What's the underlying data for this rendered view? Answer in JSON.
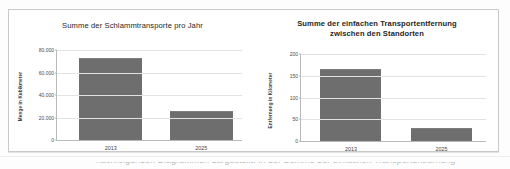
{
  "document": {
    "cutoff_text": "nachfolgenden Diagrammen dargestellt. In der Summe der einfachen Transportentfernung"
  },
  "charts": [
    {
      "id": "schlammtransporte",
      "title_lines": [
        "Summe der Schlammtransporte pro Jahr"
      ],
      "chart_data": {
        "type": "bar",
        "title": "Summe der Schlammtransporte pro Jahr",
        "xlabel": "",
        "ylabel": "Menge in Kubikmeter",
        "categories": [
          "2013",
          "2025"
        ],
        "values": [
          73000,
          26000
        ],
        "ylim": [
          0,
          80000
        ],
        "yticks": [
          "0",
          "20.000",
          "40.000",
          "60.000",
          "80.000"
        ],
        "ytick_values": [
          0,
          20000,
          40000,
          60000,
          80000
        ],
        "grid": true,
        "legend": "none",
        "series_color": "#6e6e6e"
      }
    },
    {
      "id": "transportentfernung",
      "title_lines": [
        "Summe der einfachen Transportentfernung",
        "zwischen den Standorten"
      ],
      "chart_data": {
        "type": "bar",
        "title": "Summe der einfachen Transportentfernung zwischen den Standorten",
        "xlabel": "",
        "ylabel": "Entfernung in Kilometer",
        "categories": [
          "2013",
          "2025"
        ],
        "values": [
          166,
          31
        ],
        "ylim": [
          0,
          200
        ],
        "yticks": [
          "0",
          "50",
          "100",
          "150",
          "200"
        ],
        "ytick_values": [
          0,
          50,
          100,
          150,
          200
        ],
        "grid": true,
        "legend": "none",
        "series_color": "#6e6e6e"
      }
    }
  ],
  "colors": {
    "bar": "#6e6e6e",
    "gridline": "#e3e3e3",
    "axis": "#b9b9b9",
    "frame": "#c9c9c9"
  }
}
